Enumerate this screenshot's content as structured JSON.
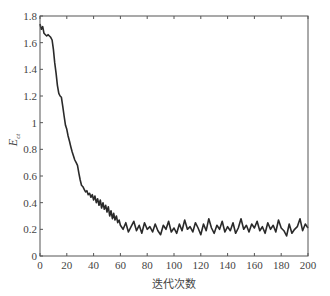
{
  "chart_data": {
    "type": "line",
    "title": "",
    "xlabel": "迭代次数",
    "ylabel": "E",
    "ylabel_subscript": "ct",
    "xlim": [
      0,
      200
    ],
    "ylim": [
      0,
      1.8
    ],
    "xticks": [
      0,
      20,
      40,
      60,
      80,
      100,
      120,
      140,
      160,
      180,
      200
    ],
    "yticks": [
      0,
      0.2,
      0.4,
      0.6,
      0.8,
      1,
      1.2,
      1.4,
      1.6,
      1.8
    ],
    "ytick_labels": [
      "0",
      "0.2",
      "0.4",
      "0.6",
      "0.8",
      "1",
      "1.2",
      "1.4",
      "1.6",
      "1.8"
    ],
    "grid": false,
    "legend": null,
    "line_color": "#2a2a2a",
    "series": [
      {
        "name": "E_ct",
        "x": [
          0,
          1,
          2,
          3,
          4,
          5,
          6,
          7,
          8,
          9,
          10,
          11,
          12,
          13,
          14,
          15,
          16,
          17,
          18,
          19,
          20,
          21,
          22,
          23,
          24,
          25,
          26,
          27,
          28,
          29,
          30,
          31,
          32,
          33,
          34,
          35,
          36,
          37,
          38,
          39,
          40,
          41,
          42,
          43,
          44,
          45,
          46,
          47,
          48,
          49,
          50,
          51,
          52,
          53,
          54,
          55,
          56,
          57,
          58,
          59,
          60,
          62,
          64,
          66,
          68,
          70,
          72,
          74,
          76,
          78,
          80,
          82,
          84,
          86,
          88,
          90,
          92,
          94,
          96,
          98,
          100,
          102,
          104,
          106,
          108,
          110,
          112,
          114,
          116,
          118,
          120,
          122,
          124,
          126,
          128,
          130,
          132,
          134,
          136,
          138,
          140,
          142,
          144,
          146,
          148,
          150,
          152,
          154,
          156,
          158,
          160,
          162,
          164,
          166,
          168,
          170,
          172,
          174,
          176,
          178,
          180,
          182,
          184,
          186,
          188,
          190,
          192,
          194,
          196,
          198,
          200
        ],
        "values": [
          1.74,
          1.7,
          1.72,
          1.67,
          1.66,
          1.65,
          1.66,
          1.65,
          1.64,
          1.62,
          1.55,
          1.45,
          1.37,
          1.28,
          1.22,
          1.2,
          1.19,
          1.12,
          1.05,
          0.98,
          0.95,
          0.9,
          0.86,
          0.82,
          0.78,
          0.75,
          0.72,
          0.7,
          0.68,
          0.62,
          0.57,
          0.53,
          0.52,
          0.5,
          0.48,
          0.49,
          0.46,
          0.47,
          0.44,
          0.46,
          0.42,
          0.45,
          0.4,
          0.43,
          0.38,
          0.42,
          0.36,
          0.4,
          0.35,
          0.38,
          0.33,
          0.37,
          0.3,
          0.34,
          0.28,
          0.32,
          0.27,
          0.3,
          0.25,
          0.27,
          0.23,
          0.2,
          0.25,
          0.18,
          0.22,
          0.26,
          0.19,
          0.23,
          0.17,
          0.25,
          0.2,
          0.22,
          0.18,
          0.24,
          0.19,
          0.16,
          0.23,
          0.2,
          0.26,
          0.18,
          0.21,
          0.17,
          0.24,
          0.19,
          0.27,
          0.2,
          0.22,
          0.18,
          0.25,
          0.21,
          0.16,
          0.24,
          0.19,
          0.28,
          0.21,
          0.17,
          0.23,
          0.2,
          0.26,
          0.18,
          0.22,
          0.19,
          0.25,
          0.17,
          0.21,
          0.28,
          0.2,
          0.23,
          0.18,
          0.24,
          0.21,
          0.26,
          0.19,
          0.22,
          0.17,
          0.25,
          0.2,
          0.23,
          0.18,
          0.27,
          0.21,
          0.19,
          0.15,
          0.24,
          0.17,
          0.2,
          0.22,
          0.28,
          0.19,
          0.24,
          0.21
        ]
      }
    ]
  }
}
